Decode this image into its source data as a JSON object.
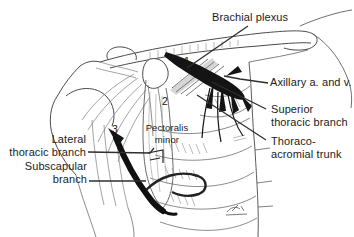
{
  "figure": {
    "type": "anatomical-illustration",
    "labels": {
      "brachial_plexus": "Brachial plexus",
      "axillary_vessels": "Axillary a. and v.",
      "superior_thoracic_branch": "Superior\nthoracic branch",
      "thoracoacromial_trunk": "Thoraco-\nacromial trunk",
      "lateral_thoracic_branch": "Lateral\nthoracic branch",
      "subscapular_branch": "Subscapular\nbranch",
      "pectoralis_minor": "Pectoralis\nminor"
    },
    "markers": {
      "m1": "1",
      "m2": "2",
      "m3": "3"
    },
    "colors": {
      "paper": "#ffffff",
      "ink": "#2e2e2e",
      "label_text": "#1b1b1b"
    }
  }
}
